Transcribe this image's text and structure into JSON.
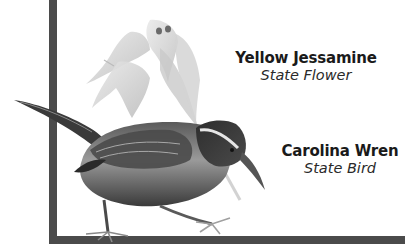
{
  "frame": {
    "color": "#4b4b4b"
  },
  "illustration": {
    "subjects": [
      "yellow-jessamine-flower",
      "carolina-wren-bird"
    ]
  },
  "captions": {
    "flower": {
      "title": "Yellow Jessamine",
      "subtitle": "State Flower"
    },
    "bird": {
      "title": "Carolina Wren",
      "subtitle": "State Bird"
    }
  }
}
